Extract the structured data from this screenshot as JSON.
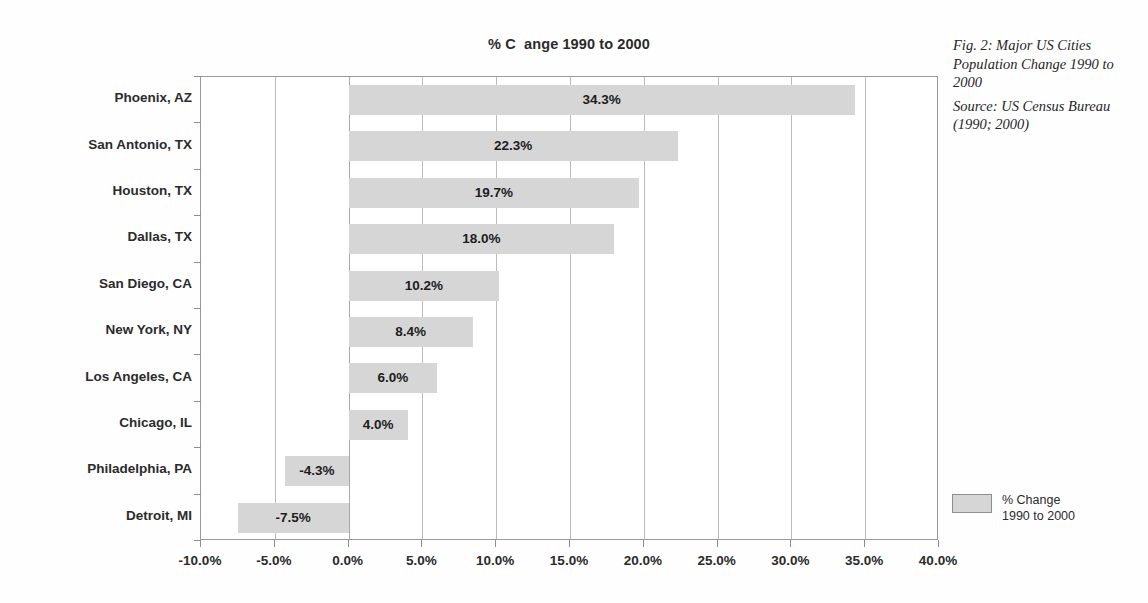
{
  "figure": {
    "caption_title": "Fig. 2: Major US Cities Population Change 1990 to 2000",
    "caption_source": "Source: US Census Bureau (1990; 2000)"
  },
  "legend": {
    "swatch_color": "#d6d6d6",
    "label_line1": "% Change",
    "label_line2": "1990 to 2000"
  },
  "chart_data": {
    "type": "bar",
    "orientation": "horizontal",
    "title": "% C  ange 1990 to 2000",
    "xlabel": "",
    "ylabel": "",
    "categories": [
      "Phoenix, AZ",
      "San Antonio, TX",
      "Houston, TX",
      "Dallas, TX",
      "San Diego, CA",
      "New York, NY",
      "Los Angeles, CA",
      "Chicago, IL",
      "Philadelphia, PA",
      "Detroit, MI"
    ],
    "values": [
      34.3,
      22.3,
      19.7,
      18.0,
      10.2,
      8.4,
      6.0,
      4.0,
      -4.3,
      -7.5
    ],
    "data_labels": [
      "34.3%",
      "22.3%",
      "19.7%",
      "18.0%",
      "10.2%",
      "8.4%",
      "6.0%",
      "4.0%",
      "-4.3%",
      "-7.5%"
    ],
    "series": [
      {
        "name": "% Change 1990 to 2000",
        "color": "#d6d6d6",
        "values": [
          34.3,
          22.3,
          19.7,
          18.0,
          10.2,
          8.4,
          6.0,
          4.0,
          -4.3,
          -7.5
        ]
      }
    ],
    "xlim": [
      -10.0,
      40.0
    ],
    "xtick_values": [
      -10.0,
      -5.0,
      0.0,
      5.0,
      10.0,
      15.0,
      20.0,
      25.0,
      30.0,
      35.0,
      40.0
    ],
    "xtick_labels": [
      "-10.0%",
      "-5.0%",
      "0.0%",
      "5.0%",
      "10.0%",
      "15.0%",
      "20.0%",
      "25.0%",
      "30.0%",
      "35.0%",
      "40.0%"
    ],
    "grid": "vertical",
    "legend_position": "right-bottom",
    "bar_color": "#d6d6d6",
    "frame_color": "#9a9a9a"
  }
}
